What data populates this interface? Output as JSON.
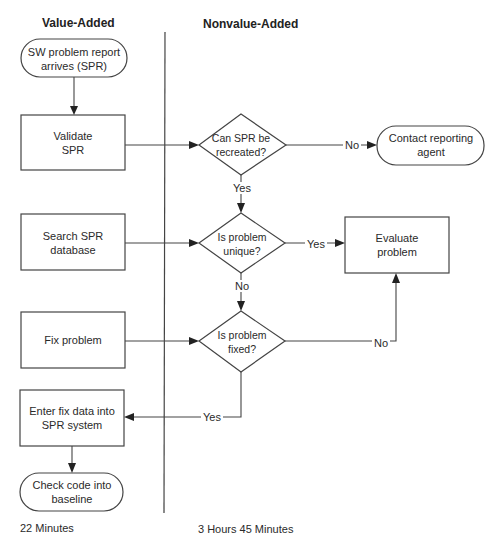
{
  "lanes": {
    "value_added": "Value-Added",
    "nonvalue_added": "Nonvalue-Added"
  },
  "nodes": {
    "start": "SW problem report arrives (SPR)",
    "validate": "Validate SPR",
    "can_recreate": "Can SPR be recreated?",
    "contact": "Contact reporting agent",
    "search": "Search SPR database",
    "is_unique": "Is problem unique?",
    "evaluate": "Evaluate problem",
    "fix": "Fix problem",
    "is_fixed": "Is problem fixed?",
    "enter_fix": "Enter fix data into SPR system",
    "check_code": "Check code into baseline"
  },
  "edges": {
    "recreate_no": "No",
    "recreate_yes": "Yes",
    "unique_yes": "Yes",
    "unique_no": "No",
    "fixed_no": "No",
    "fixed_yes": "Yes"
  },
  "footer": {
    "value_added_time": "22 Minutes",
    "nonvalue_added_time": "3 Hours 45 Minutes"
  }
}
